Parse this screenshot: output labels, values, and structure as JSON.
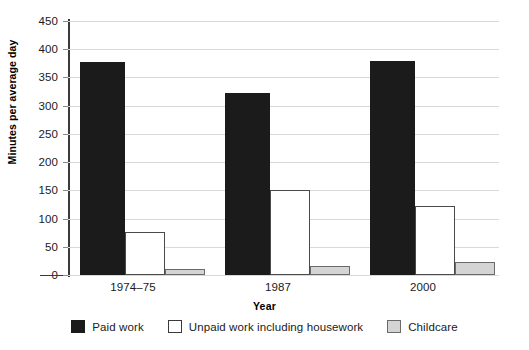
{
  "chart_data": {
    "type": "bar",
    "title": "",
    "xlabel": "Year",
    "ylabel": "Minutes per average day",
    "categories": [
      "1974–75",
      "1987",
      "2000"
    ],
    "series": [
      {
        "name": "Paid work",
        "color": "#1b1b1b",
        "values": [
          377,
          323,
          379
        ]
      },
      {
        "name": "Unpaid work including housework",
        "color": "#ffffff",
        "values": [
          77,
          150,
          122
        ]
      },
      {
        "name": "Childcare",
        "color": "#d4d4d4",
        "values": [
          10,
          16,
          23
        ]
      }
    ],
    "ylim": [
      0,
      450
    ],
    "ytick_step": 50,
    "yticks": [
      0,
      50,
      100,
      150,
      200,
      250,
      300,
      350,
      400,
      450
    ],
    "ytick_labels": [
      "0",
      "50",
      "100",
      "150",
      "200",
      "250",
      "300",
      "350",
      "400",
      "450"
    ],
    "grid": true,
    "grid_axis": "y",
    "legend_position": "bottom"
  },
  "axes": {
    "y_title": "Minutes per average day",
    "x_title": "Year"
  },
  "legend": {
    "items": [
      {
        "label": "Paid work",
        "swatch": "black-filled-swatch"
      },
      {
        "label": "Unpaid work including housework",
        "swatch": "white-outlined-swatch"
      },
      {
        "label": "Childcare",
        "swatch": "grey-filled-swatch"
      }
    ]
  }
}
